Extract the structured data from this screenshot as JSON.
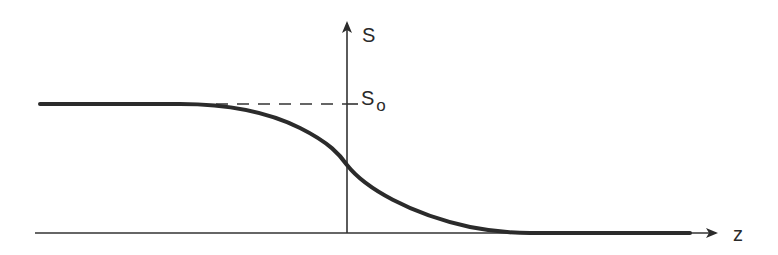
{
  "diagram": {
    "type": "sigmoid-profile",
    "axes": {
      "vertical_label": "S",
      "horizontal_label": "z"
    },
    "reference_level": {
      "label_main": "S",
      "label_subscript": "o",
      "style": "dashed"
    },
    "colors": {
      "line": "#2b2b2b",
      "axis": "#333333",
      "background": "#ffffff"
    }
  }
}
